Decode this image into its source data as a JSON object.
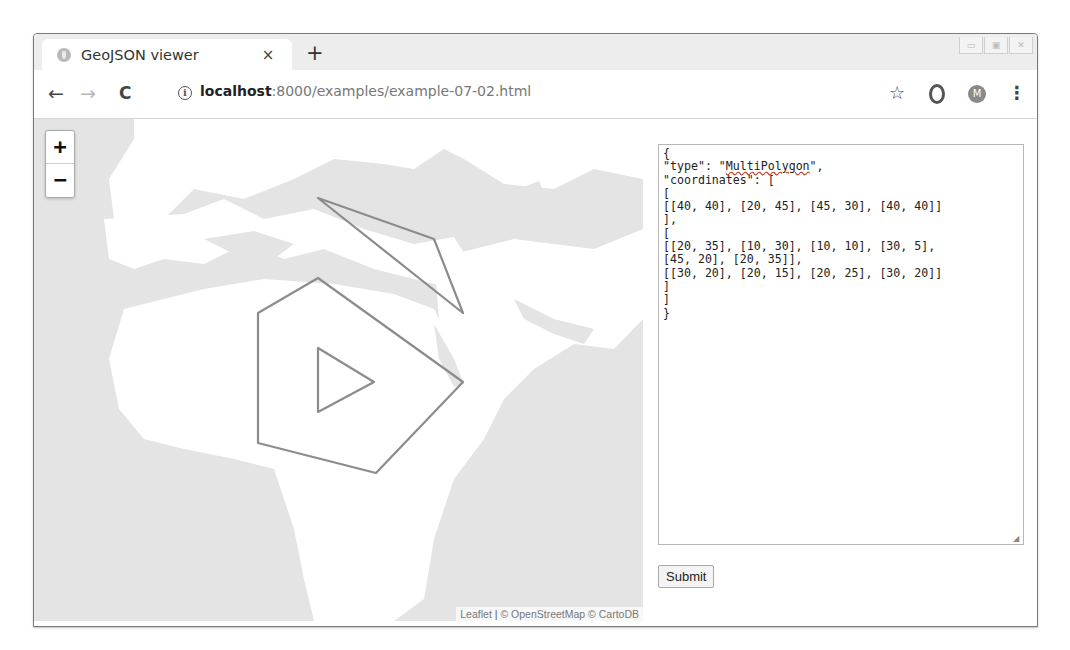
{
  "browser": {
    "tab": {
      "title": "GeoJSON viewer",
      "close_glyph": "×"
    },
    "new_tab_glyph": "+",
    "window_controls": [
      "minimize",
      "maximize",
      "close"
    ],
    "toolbar": {
      "back_glyph": "←",
      "forward_glyph": "→",
      "reload_glyph": "C",
      "info_glyph": "i",
      "url_host": "localhost",
      "url_rest": ":8000/examples/example-07-02.html",
      "bookmark_glyph": "☆",
      "profile_initial": "M",
      "menu_glyph": "⋮"
    }
  },
  "map": {
    "zoom_in_label": "+",
    "zoom_out_label": "−",
    "attribution": {
      "leaflet": "Leaflet",
      "separator": " | ",
      "osm": "© OpenStreetMap",
      "carto": " © CartoDB"
    },
    "colors": {
      "sea": "#e4e4e4",
      "land": "#ffffff",
      "polygon_stroke": "#8c8c8c"
    },
    "geojson_rendered": {
      "type": "MultiPolygon",
      "polygons": [
        {
          "outer": [
            [
              40,
              40
            ],
            [
              20,
              45
            ],
            [
              45,
              30
            ],
            [
              40,
              40
            ]
          ]
        },
        {
          "outer": [
            [
              20,
              35
            ],
            [
              10,
              30
            ],
            [
              10,
              10
            ],
            [
              30,
              5
            ],
            [
              45,
              20
            ],
            [
              20,
              35
            ]
          ],
          "hole": [
            [
              30,
              20
            ],
            [
              20,
              15
            ],
            [
              20,
              25
            ],
            [
              30,
              20
            ]
          ]
        }
      ]
    }
  },
  "editor": {
    "lines": [
      "{",
      "\"type\": \"MultiPolygon\",",
      "\"coordinates\": [",
      "[",
      "[[40, 40], [20, 45], [45, 30], [40, 40]]",
      "],",
      "[",
      "[[20, 35], [10, 30], [10, 10], [30, 5],",
      "[45, 20], [20, 35]],",
      "[[30, 20], [20, 15], [20, 25], [30, 20]]",
      "]",
      "]",
      "}"
    ],
    "type_line_prefix": "\"type\": \"",
    "type_value": "MultiPolygon",
    "type_line_suffix": "\","
  },
  "submit_label": "Submit"
}
